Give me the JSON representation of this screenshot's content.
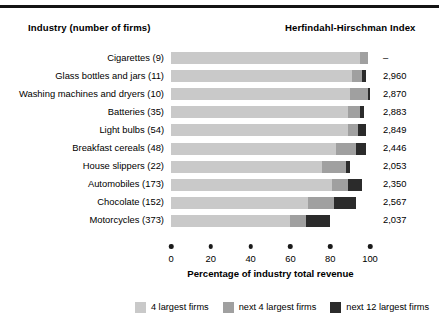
{
  "header": {
    "industry_label": "Industry (number of firms)",
    "hhi_label": "Herfindahl-Hirschman Index"
  },
  "chart_data": {
    "type": "bar",
    "orientation": "horizontal",
    "stacked": true,
    "title": "",
    "xlabel": "Percentage of industry total revenue",
    "ylabel": "",
    "xlim": [
      0,
      100
    ],
    "xticks": [
      0,
      20,
      40,
      60,
      80,
      100
    ],
    "xtick_labels": [
      "0",
      "20",
      "40",
      "60",
      "80",
      "100"
    ],
    "grid": false,
    "legend_position": "bottom-right",
    "categories": [
      "Cigarettes  (9)",
      "Glass bottles and jars  (11)",
      "Washing machines and dryers  (10)",
      "Batteries  (35)",
      "Light bulbs  (54)",
      "Breakfast cereals  (48)",
      "House slippers  (22)",
      "Automobiles  (173)",
      "Chocolate  (152)",
      "Motorcycles  (373)"
    ],
    "series": [
      {
        "name": "4 largest firms",
        "color": "#c9c9c9",
        "values": [
          95,
          91,
          90,
          89,
          89,
          83,
          76,
          81,
          69,
          60
        ]
      },
      {
        "name": "next 4 largest firms",
        "color": "#a0a0a0",
        "values": [
          4,
          5,
          9,
          6,
          5,
          10,
          12,
          8,
          13,
          8
        ]
      },
      {
        "name": "next 12 largest firms",
        "color": "#2b2b2b",
        "values": [
          0,
          2,
          1,
          2,
          4,
          5,
          2,
          7,
          11,
          12
        ]
      }
    ],
    "annotations": {
      "right_axis_title": "Herfindahl-Hirschman Index",
      "right_values": [
        "–",
        "2,960",
        "2,870",
        "2,883",
        "2,849",
        "2,446",
        "2,053",
        "2,350",
        "2,567",
        "2,037"
      ]
    }
  },
  "legend": [
    {
      "label": "4 largest firms",
      "color": "#c9c9c9"
    },
    {
      "label": "next 4 largest firms",
      "color": "#a0a0a0"
    },
    {
      "label": "next 12 largest firms",
      "color": "#2b2b2b"
    }
  ]
}
